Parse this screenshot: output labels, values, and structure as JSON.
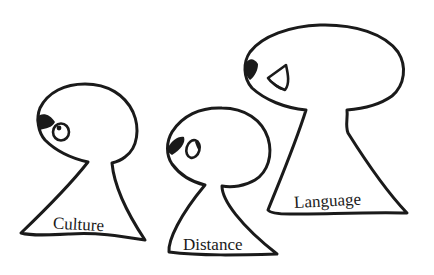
{
  "illustration": {
    "description": "Three hand-drawn keyhole-shaped figures facing left, increasing in size",
    "figures": [
      {
        "id": "culture",
        "label": "Culture"
      },
      {
        "id": "distance",
        "label": "Distance"
      },
      {
        "id": "language",
        "label": "Language"
      }
    ],
    "colors": {
      "ink": "#1a1a1a",
      "background": "#ffffff"
    }
  }
}
